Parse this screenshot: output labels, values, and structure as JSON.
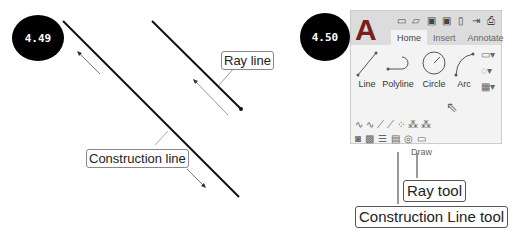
{
  "figure_left": {
    "badge": "4.49",
    "callouts": {
      "ray_line": "Ray line",
      "construction_line": "Construction line"
    }
  },
  "figure_right": {
    "badge": "4.50",
    "ribbon": {
      "tabs": [
        {
          "label": "Home",
          "active": true
        },
        {
          "label": "Insert",
          "active": false
        },
        {
          "label": "Annotate",
          "active": false
        }
      ],
      "quick_access_icons": [
        "new-icon",
        "open-icon",
        "save-icon",
        "save-as-icon",
        "plot-icon",
        "import-icon",
        "print-icon"
      ],
      "tools": [
        {
          "label": "Line"
        },
        {
          "label": "Polyline"
        },
        {
          "label": "Circle"
        },
        {
          "label": "Arc"
        }
      ],
      "panel_label": "Draw"
    },
    "callouts": {
      "ray_tool": "Ray tool",
      "construction_line_tool": "Construction Line tool"
    }
  }
}
